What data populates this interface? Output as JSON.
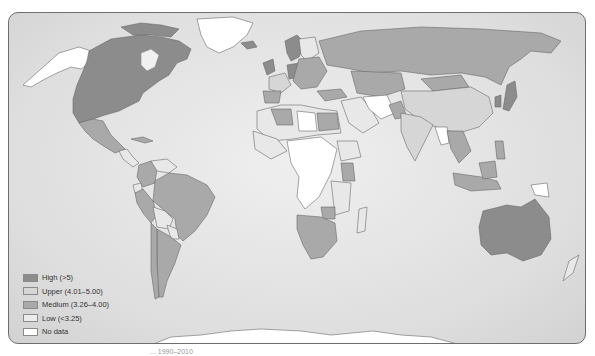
{
  "map": {
    "type": "choropleth-world",
    "background_color": "#dcdcdc",
    "border_color": "#6e6e6e"
  },
  "legend": {
    "items": [
      {
        "label": "High (>5)",
        "color": "#8c8c8c"
      },
      {
        "label": "Upper (4.01–5.00)",
        "color": "#d6d6d6"
      },
      {
        "label": "Medium (3.26–4.00)",
        "color": "#a9a9a9"
      },
      {
        "label": "Low (<3.25)",
        "color": "#e8e8e8"
      },
      {
        "label": "No data",
        "color": "#ffffff"
      }
    ]
  },
  "regions": {
    "high": [
      "United States",
      "Canada",
      "Australia",
      "Japan",
      "Germany",
      "United Kingdom",
      "Norway",
      "Netherlands"
    ],
    "upper": [
      "China",
      "India",
      "France",
      "Mongolia"
    ],
    "medium": [
      "Russia",
      "Brazil",
      "Argentina",
      "Chile",
      "Peru",
      "Colombia",
      "Mexico",
      "Kazakhstan",
      "Turkey",
      "South Africa",
      "Namibia",
      "Botswana",
      "Kenya",
      "Zimbabwe",
      "Egypt",
      "Indonesia",
      "Malaysia",
      "Thailand",
      "Vietnam",
      "Philippines",
      "Spain",
      "Algeria",
      "Pakistan"
    ],
    "low": [
      "Bolivia",
      "Venezuela",
      "Paraguay",
      "Ecuador",
      "Ethiopia",
      "Madagascar",
      "Saudi Arabia",
      "Iran",
      "Nigeria",
      "Tanzania",
      "Mozambique",
      "New Zealand"
    ],
    "no_data": [
      "Greenland",
      "Antarctica",
      "Alaska (Arctic)",
      "Myanmar",
      "Papua New Guinea",
      "DR Congo",
      "Libya",
      "Angola",
      "Afghanistan",
      "Sudan"
    ]
  },
  "caption": {
    "text": "... 1990–2010"
  }
}
